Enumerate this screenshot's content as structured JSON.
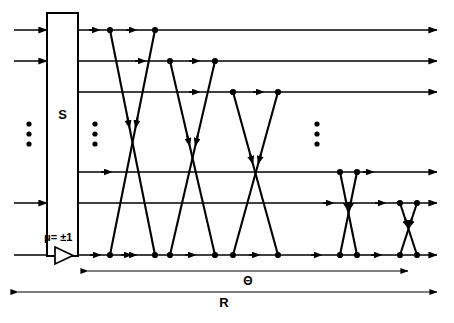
{
  "figure": {
    "type": "butterfly-interconnection-network-diagram",
    "background_color": "#ffffff",
    "ink_color": "#000000",
    "width": 454,
    "height": 323
  },
  "labels": {
    "switch_box": "S",
    "gain": "μ= ±1",
    "theta_span": "Θ",
    "r_span": "R",
    "ellipsis": "⋮"
  },
  "switch_box": {
    "name": "S",
    "x": 47,
    "y": 13,
    "width": 31,
    "height": 243
  },
  "amplifier": {
    "label": "μ= ±1",
    "label_x": 44,
    "label_y": 241,
    "tri_x": 55,
    "tri_y_top": 247,
    "tri_y_bottom": 264,
    "tri_x_tip": 73
  },
  "buses": {
    "count": 6,
    "y": [
      30,
      61,
      92,
      172,
      203,
      255
    ],
    "input_x_start": 14,
    "input_x_end": 47,
    "output_x_start": 78,
    "output_x_end": 437,
    "bottom_bus_index": 5
  },
  "ellipses": [
    {
      "name": "input-ellipsis",
      "x": 29,
      "y": [
        124,
        134,
        144
      ]
    },
    {
      "name": "stage-ellipsis-left",
      "x": 95,
      "y": [
        124,
        134,
        144
      ]
    },
    {
      "name": "stage-ellipsis-right",
      "x": 317,
      "y": [
        124,
        134,
        144
      ]
    }
  ],
  "crossings": [
    {
      "name": "crossing-1",
      "a_x": 110,
      "a_bus": 0,
      "b_x": 155,
      "b_bus": 5
    },
    {
      "name": "crossing-2",
      "a_x": 155,
      "a_bus": 0,
      "b_x": 110,
      "b_bus": 5
    },
    {
      "name": "crossing-3",
      "a_x": 170,
      "a_bus": 1,
      "b_x": 215,
      "b_bus": 5
    },
    {
      "name": "crossing-4",
      "a_x": 215,
      "a_bus": 1,
      "b_x": 170,
      "b_bus": 5
    },
    {
      "name": "crossing-5",
      "a_x": 233,
      "a_bus": 2,
      "b_x": 278,
      "b_bus": 5
    },
    {
      "name": "crossing-6",
      "a_x": 278,
      "a_bus": 2,
      "b_x": 233,
      "b_bus": 5
    },
    {
      "name": "crossing-7",
      "a_x": 340,
      "a_bus": 3,
      "b_x": 357,
      "b_bus": 5
    },
    {
      "name": "crossing-8",
      "a_x": 357,
      "a_bus": 3,
      "b_x": 340,
      "b_bus": 5
    },
    {
      "name": "crossing-9",
      "a_x": 400,
      "a_bus": 4,
      "b_x": 417,
      "b_bus": 5
    },
    {
      "name": "crossing-10",
      "a_x": 417,
      "a_bus": 4,
      "b_x": 400,
      "b_bus": 5
    }
  ],
  "bottom_nodes_x": [
    110,
    155,
    170,
    215,
    233,
    278,
    295,
    340,
    357,
    400,
    417
  ],
  "measures": [
    {
      "name": "theta-measure",
      "label": "Θ",
      "x1": 88,
      "x2": 408,
      "y": 271,
      "label_x": 248,
      "label_y": 285,
      "arrow_left": true,
      "arrow_right": true
    },
    {
      "name": "r-measure",
      "label": "R",
      "x1": 18,
      "x2": 437,
      "y": 292,
      "label_x": 224,
      "label_y": 307,
      "arrow_left": true,
      "arrow_right": true
    }
  ]
}
